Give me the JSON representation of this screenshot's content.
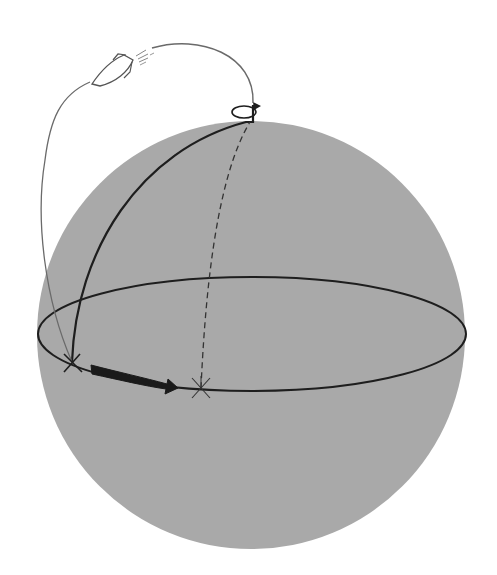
{
  "diagram": {
    "colors": {
      "background": "#ffffff",
      "sphere_fill": "#a9a9a9",
      "line_dark": "#1e1e1e",
      "line_trajectory": "#6a6a6a",
      "arrow_fill": "#1a1a1a"
    },
    "sphere": {
      "cx": 251,
      "cy": 335,
      "r": 214
    },
    "equator": {
      "cx": 252,
      "cy": 334,
      "rx": 214,
      "ry": 57
    },
    "points": {
      "launch_point": {
        "x": 72,
        "y": 362,
        "marker": "x-marker"
      },
      "landing_point": {
        "x": 201,
        "y": 388,
        "marker": "asterisk-marker"
      },
      "north_pole": {
        "x": 250,
        "y": 122
      }
    },
    "elements": [
      {
        "name": "sphere",
        "icon": "circle"
      },
      {
        "name": "equator",
        "icon": "ellipse"
      },
      {
        "name": "launch-meridian",
        "style": "solid"
      },
      {
        "name": "landing-meridian",
        "style": "dashed"
      },
      {
        "name": "rotation-axis",
        "icon": "rotation-arrow-icon"
      },
      {
        "name": "trajectory",
        "style": "thin-curve"
      },
      {
        "name": "rocket",
        "icon": "rocket-icon"
      },
      {
        "name": "drift-arrow",
        "icon": "thick-arrow-right-icon"
      }
    ]
  }
}
